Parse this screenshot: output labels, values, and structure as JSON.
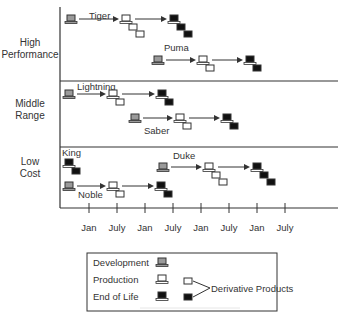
{
  "diagram": {
    "rows": [
      {
        "id": "high",
        "label_lines": [
          "High",
          "Performance"
        ]
      },
      {
        "id": "middle",
        "label_lines": [
          "Middle",
          "Range"
        ]
      },
      {
        "id": "low",
        "label_lines": [
          "Low",
          "Cost"
        ]
      }
    ],
    "x_axis": {
      "ticks": [
        "Jan",
        "July",
        "Jan",
        "July",
        "Jan",
        "July",
        "Jan",
        "July"
      ]
    },
    "products": [
      {
        "name": "Tiger",
        "row": "high",
        "stages": [
          {
            "stage": "development",
            "x": 66,
            "y": 15
          },
          {
            "stage": "production",
            "x": 121,
            "y": 15,
            "derivatives": 2
          },
          {
            "stage": "end_of_life",
            "x": 169,
            "y": 15,
            "derivatives": 2
          }
        ],
        "label_pos": [
          89,
          19
        ]
      },
      {
        "name": "Puma",
        "row": "high",
        "stages": [
          {
            "stage": "development",
            "x": 153,
            "y": 56
          },
          {
            "stage": "production",
            "x": 198,
            "y": 56,
            "derivatives": 1
          },
          {
            "stage": "end_of_life",
            "x": 245,
            "y": 56,
            "derivatives": 1
          }
        ],
        "label_pos": [
          164,
          51
        ]
      },
      {
        "name": "Lightning",
        "row": "middle",
        "stages": [
          {
            "stage": "development",
            "x": 64,
            "y": 90
          },
          {
            "stage": "production",
            "x": 108,
            "y": 90,
            "derivatives": 1
          },
          {
            "stage": "end_of_life",
            "x": 157,
            "y": 90,
            "derivatives": 1
          }
        ],
        "label_pos": [
          77,
          90
        ]
      },
      {
        "name": "Saber",
        "row": "middle",
        "stages": [
          {
            "stage": "development",
            "x": 130,
            "y": 114
          },
          {
            "stage": "production",
            "x": 175,
            "y": 114,
            "derivatives": 1
          },
          {
            "stage": "end_of_life",
            "x": 222,
            "y": 114,
            "derivatives": 1
          }
        ],
        "label_pos": [
          144,
          134
        ]
      },
      {
        "name": "King",
        "row": "low",
        "stages": [
          {
            "stage": "end_of_life",
            "x": 64,
            "y": 159,
            "derivatives": 1
          }
        ],
        "label_pos": [
          62,
          156
        ]
      },
      {
        "name": "Noble",
        "row": "low",
        "stages": [
          {
            "stage": "development",
            "x": 64,
            "y": 182
          },
          {
            "stage": "production",
            "x": 108,
            "y": 182,
            "derivatives": 1
          },
          {
            "stage": "end_of_life",
            "x": 156,
            "y": 182,
            "derivatives": 1
          }
        ],
        "label_pos": [
          78,
          198
        ]
      },
      {
        "name": "Duke",
        "row": "low",
        "stages": [
          {
            "stage": "development",
            "x": 158,
            "y": 163
          },
          {
            "stage": "production",
            "x": 204,
            "y": 163,
            "derivatives": 2
          },
          {
            "stage": "end_of_life",
            "x": 252,
            "y": 163,
            "derivatives": 2
          }
        ],
        "label_pos": [
          173,
          159
        ]
      }
    ]
  },
  "legend": {
    "development_label": "Development",
    "production_label": "Production",
    "end_of_life_label": "End of Life",
    "derivative_label": "Derivative Products"
  },
  "colors": {
    "line": "#333333",
    "development_fill": "#9a9a9a",
    "production_fill": "#ffffff",
    "end_of_life_fill": "#111111"
  }
}
